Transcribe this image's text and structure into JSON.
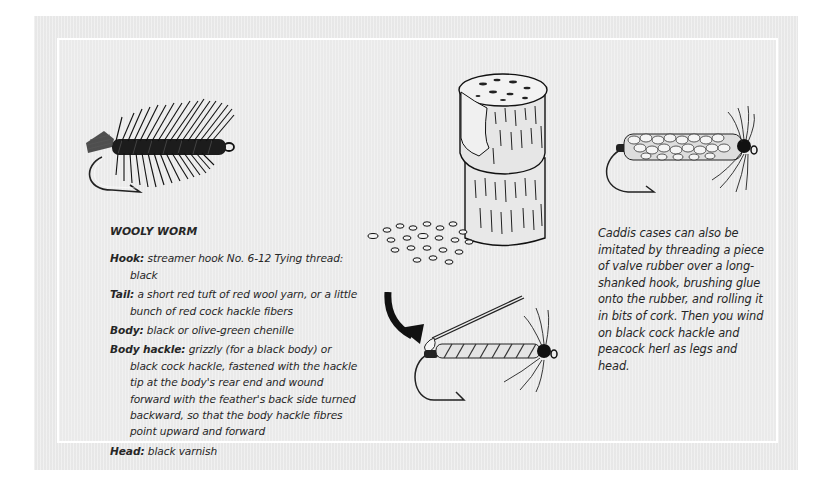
{
  "recipe": {
    "title": "WOOLY WORM",
    "rows": [
      {
        "label": "Hook:",
        "text": " streamer hook No. 6-12 Tying thread: black"
      },
      {
        "label": "Tail:",
        "text": " a short red tuft of red wool yarn, or a little bunch of red cock hackle fibers"
      },
      {
        "label": "Body:",
        "text": " black or olive-green chenille"
      },
      {
        "label": "Body hackle:",
        "text": " grizzly (for a black body) or black cock hackle, fastened with the hackle tip at the body's rear end and wound forward with the feather's back side turned backward, so that the body hackle fibres point upward and forward"
      },
      {
        "label": "Head:",
        "text": " black varnish"
      }
    ]
  },
  "caddis": {
    "text": "Caddis cases can also be imitated by threading a piece of valve rubber over a long-shanked hook, brushing glue onto the rubber, and rolling it in bits of cork. Then you wind on black cock hackle and peacock herl as legs and head."
  },
  "illustrations": {
    "wooly_worm": "wooly-worm-fly-illustration",
    "cork": "cork-stopper-and-crumbs-illustration",
    "caddis_cork": "cork-caddis-fly-illustration",
    "caddis_rubber": "rubber-caddis-fly-with-needle-illustration"
  },
  "colors": {
    "panel": "#ececec",
    "inner_border": "#ffffff",
    "text": "#262626",
    "ink": "#1a1a1a"
  }
}
